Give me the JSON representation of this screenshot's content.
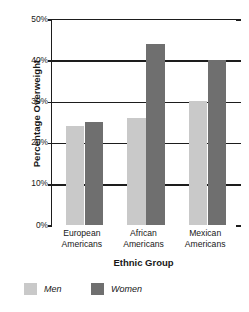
{
  "chart_data": {
    "type": "bar",
    "title": "",
    "xlabel": "Ethnic Group",
    "ylabel": "Percentage Overweight",
    "categories": [
      "European Americans",
      "African Americans",
      "Mexican Americans"
    ],
    "category_lines": [
      [
        "European",
        "Americans"
      ],
      [
        "African",
        "Americans"
      ],
      [
        "Mexican",
        "Americans"
      ]
    ],
    "series": [
      {
        "name": "Men",
        "color": "#c9c9c9",
        "values": [
          24,
          26,
          30
        ]
      },
      {
        "name": "Women",
        "color": "#6f6f6f",
        "values": [
          25,
          44,
          40
        ]
      }
    ],
    "ylim": [
      0,
      50
    ],
    "yticks": [
      0,
      10,
      20,
      30,
      40,
      50
    ],
    "ytick_labels": [
      "0%",
      "10%",
      "20%",
      "30%",
      "40%",
      "50%"
    ],
    "grid": true,
    "grid_axis": "y",
    "legend_position": "bottom-left",
    "value_unit": "%"
  },
  "axes": {
    "y_title": "Percentage Overweight",
    "x_title": "Ethnic Group"
  },
  "legend": {
    "items": [
      {
        "label": "Men",
        "color": "#c9c9c9"
      },
      {
        "label": "Women",
        "color": "#6f6f6f"
      }
    ]
  },
  "colors": {
    "men": "#c9c9c9",
    "women": "#6f6f6f",
    "axis": "#1d1d1d",
    "text": "#171717",
    "background": "#ffffff"
  }
}
